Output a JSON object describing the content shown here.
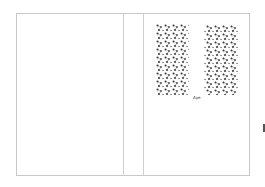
{
  "layout": {
    "panels": [
      {
        "name": "back-cover",
        "label": ""
      },
      {
        "name": "spine",
        "label": ""
      },
      {
        "name": "front-cover",
        "label": ""
      }
    ]
  },
  "front_cover": {
    "pattern_blocks": [
      {
        "name": "left-floral-block",
        "x": 156,
        "y": 24,
        "w": 33,
        "h": 71
      },
      {
        "name": "right-floral-block",
        "x": 204,
        "y": 24,
        "w": 34,
        "h": 71
      }
    ],
    "signature_text": "Ауе"
  },
  "colors": {
    "border": "#c8c8c8",
    "pattern": "#333333",
    "background": "#ffffff"
  }
}
